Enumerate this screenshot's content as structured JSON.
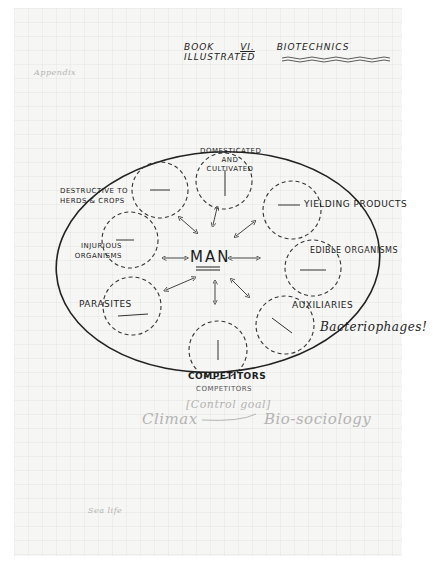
{
  "header": {
    "book": "BOOK",
    "volume": "VI.",
    "title": "BIOTECHNICS  ILLUSTRATED"
  },
  "margin_notes": {
    "top_left_faint": "Appendix",
    "bottom_left_faint": "Sea life"
  },
  "diagram": {
    "center": "MAN",
    "nodes": [
      {
        "id": "domesticated",
        "label": "DOMESTICATED AND CULTIVATED"
      },
      {
        "id": "yielding",
        "label": "YIELDING PRODUCTS"
      },
      {
        "id": "edible",
        "label": "EDIBLE ORGANISMS"
      },
      {
        "id": "auxiliaries",
        "label": "AUXILIARIES"
      },
      {
        "id": "competitors",
        "label": "COMPETITORS"
      },
      {
        "id": "parasites",
        "label": "PARASITES"
      },
      {
        "id": "injurious",
        "label": "INJURIOUS ORGANISMS"
      },
      {
        "id": "destructive",
        "label": "DESTRUCTIVE TO HERDS & CROPS"
      }
    ],
    "annotations": {
      "auxiliaries_note": "Bacteriophages!",
      "competitors_caption": "COMPETITORS",
      "bracket_note": "[Control goal]",
      "left_term": "Climax",
      "right_term": "Bio-sociology"
    }
  },
  "colors": {
    "ink": "#1c1c1c",
    "pencil": "#b3b3b3",
    "paper": "#f6f6f4"
  }
}
